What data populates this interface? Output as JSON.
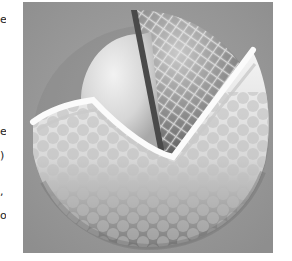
{
  "figure": {
    "layers": [
      {
        "name": "cover",
        "description": "white dimpled outer shell"
      },
      {
        "name": "mantle",
        "description": "netted / mesh textured layer"
      },
      {
        "name": "core",
        "description": "smooth pale spherical core"
      }
    ],
    "colors": {
      "background": "#9b9b9b",
      "cover": "#e8e8e8",
      "core": "#d4d4d4",
      "mantle": "#8a8a8a",
      "shadow": "#5a5a5a"
    }
  },
  "margin_fragments": [
    {
      "char": "e",
      "y": 14
    },
    {
      "char": "e",
      "y": 126
    },
    {
      "char": ")",
      "y": 150
    },
    {
      "char": ",",
      "y": 186
    },
    {
      "char": "o",
      "y": 210
    }
  ]
}
